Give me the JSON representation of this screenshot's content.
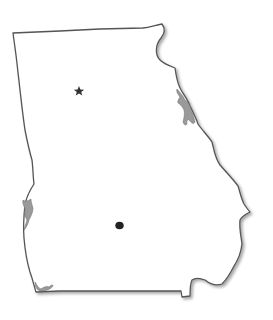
{
  "map": {
    "region": "Georgia",
    "outline_color": "#555555",
    "fill_color": "#ffffff",
    "water_color": "#9a9a9a",
    "markers": [
      {
        "type": "star",
        "icon": "star-icon",
        "meaning": "state capital",
        "x": 79,
        "y": 91,
        "color": "#333333"
      },
      {
        "type": "dot",
        "icon": "dot-icon",
        "x": 119,
        "y": 225,
        "color": "#222222"
      }
    ]
  }
}
